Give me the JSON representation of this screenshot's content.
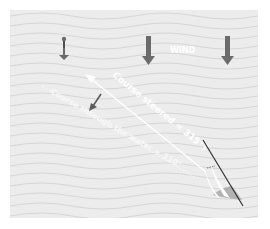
{
  "diagram": {
    "wind_label": "WIND",
    "course_steered_label": "Course steered = 315°T",
    "course_water_label": "Course through the water = 310°",
    "colors": {
      "background": "#ececec",
      "wave_line": "#d6d6d6",
      "arrow_dark": "#6b6b6b",
      "text_white": "#ffffff",
      "boat_hull": "#9a9a9a",
      "mast": "#333333"
    }
  }
}
